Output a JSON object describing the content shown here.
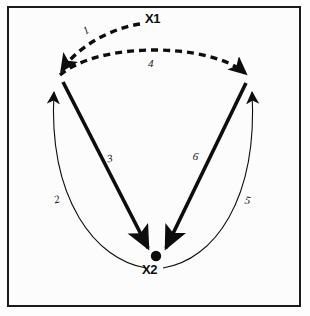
{
  "figure": {
    "background_color": "#fcfcfc",
    "frame_color": "#1a1a1a",
    "ink_color": "#0d0d0d"
  },
  "nodes": [
    {
      "id": "x1",
      "label": "X1",
      "x": 152,
      "y": 20
    },
    {
      "id": "x2",
      "label": "X2",
      "x": 154,
      "y": 269
    }
  ],
  "edges": [
    {
      "id": "e1",
      "label": "1",
      "style": "dashed",
      "weight": "thick",
      "from": "x1",
      "to": "left-apex"
    },
    {
      "id": "e2",
      "label": "2",
      "style": "solid",
      "weight": "thin",
      "from": "x2",
      "to": "left-apex"
    },
    {
      "id": "e3",
      "label": "3",
      "style": "solid",
      "weight": "thick",
      "from": "left-apex",
      "to": "x2"
    },
    {
      "id": "e4",
      "label": "4",
      "style": "dashed",
      "weight": "thick",
      "from": "left-apex",
      "to": "right-apex"
    },
    {
      "id": "e5",
      "label": "5",
      "style": "solid",
      "weight": "thin",
      "from": "x2",
      "to": "right-apex"
    },
    {
      "id": "e6",
      "label": "6",
      "style": "solid",
      "weight": "thick",
      "from": "right-apex",
      "to": "x2"
    }
  ],
  "markers": {
    "x2_dot_color": "#0d0d0d"
  }
}
